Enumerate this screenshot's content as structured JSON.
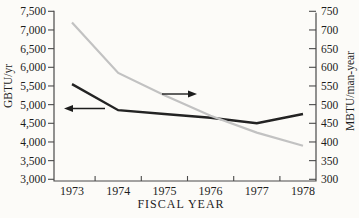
{
  "chart_data": {
    "type": "line",
    "title": "",
    "xlabel": "FISCAL YEAR",
    "x": [
      "1973",
      "1974",
      "1975",
      "1976",
      "1977",
      "1978"
    ],
    "left_axis": {
      "label": "GBTU/yr",
      "min": 3000,
      "max": 7500,
      "step": 500,
      "tick_labels": [
        "3,000",
        "3,500",
        "4,000",
        "4,500",
        "5,000",
        "5,500",
        "6,000",
        "6,500",
        "7,000",
        "7,500"
      ]
    },
    "right_axis": {
      "label": "MBTU/man-year",
      "min": 300,
      "max": 750,
      "step": 50,
      "tick_labels": [
        "300",
        "350",
        "400",
        "450",
        "500",
        "550",
        "600",
        "650",
        "700",
        "750"
      ]
    },
    "series": [
      {
        "name": "total-energy-gbtu-per-yr",
        "axis": "left",
        "color": "#232323",
        "width": 2.4,
        "values": [
          5550,
          4850,
          4750,
          4650,
          4500,
          4750
        ]
      },
      {
        "name": "energy-intensity-mbtu-per-man-year",
        "axis": "right",
        "color": "#c2c2c2",
        "width": 2.2,
        "values": [
          720,
          585,
          525,
          470,
          425,
          390
        ]
      }
    ],
    "annotations": [
      {
        "type": "arrow",
        "points_to": "left-axis",
        "dir": "left",
        "tip_x": 64,
        "tail_x": 105,
        "y": 108.5
      },
      {
        "type": "arrow",
        "points_to": "right-axis",
        "dir": "right",
        "tip_x": 197,
        "tail_x": 162,
        "y": 94
      }
    ],
    "layout": {
      "plot": {
        "left": 54,
        "right": 316,
        "top": 11,
        "bottom": 181
      },
      "tick_top": 11.3,
      "tick_bottom": 179.3,
      "first_inset": 18,
      "last_inset": 13,
      "grid": false,
      "legend": "none",
      "colors": {
        "axis": "#4a4a4a",
        "text": "#1d1d1d",
        "background": "#fcfbf8"
      },
      "left_title_pos": {
        "x": 8,
        "y": 86
      },
      "right_title_pos": {
        "x": 350,
        "y": 91
      },
      "x_title_pos": {
        "x": 181,
        "y": 204
      }
    }
  }
}
